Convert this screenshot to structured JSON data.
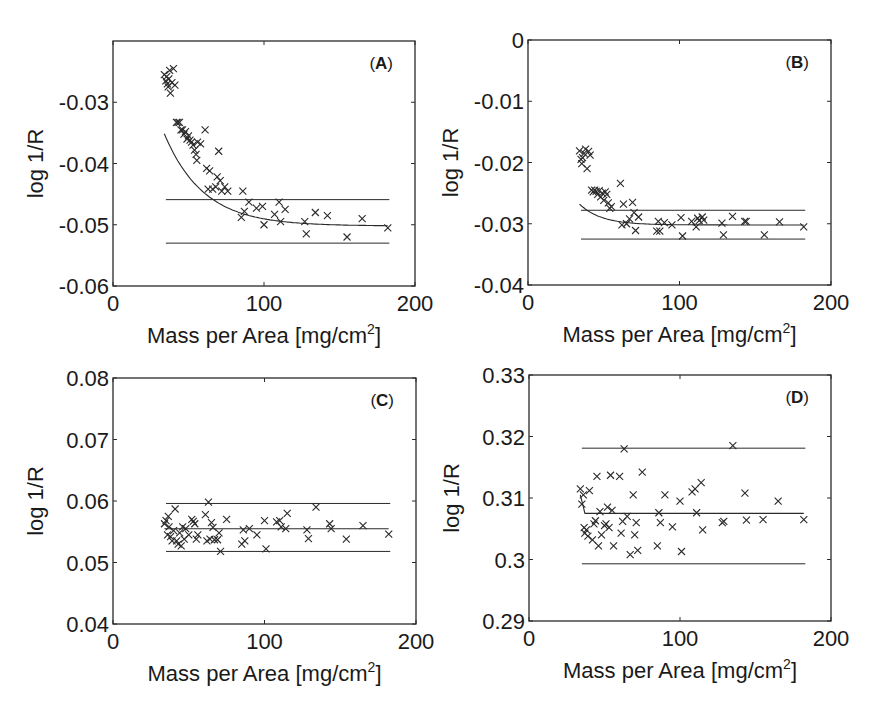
{
  "figure": {
    "width": 881,
    "height": 716,
    "ink_color": "#2a2a2a",
    "marker": "x"
  },
  "chart_data": [
    {
      "id": "A",
      "type": "scatter",
      "panel_label": "(A)",
      "panel_label_bold": "A",
      "xlabel": "Mass per Area [mg/cm",
      "xlabel_sup": "2",
      "xlabel_close": "]",
      "ylabel": "log 1/R",
      "xlim": [
        0,
        200
      ],
      "ylim": [
        -0.06,
        -0.02
      ],
      "xticks": [
        0,
        100,
        200
      ],
      "xtick_labels": [
        "0",
        "100",
        "200"
      ],
      "yticks": [
        -0.06,
        -0.05,
        -0.04,
        -0.03
      ],
      "ytick_labels": [
        "-0.06",
        "-0.05",
        "-0.04",
        "-0.03"
      ],
      "grid": false,
      "box": {
        "left": 113,
        "top": 41,
        "right": 415,
        "bottom": 286
      },
      "points": [
        [
          34,
          -0.0255
        ],
        [
          35,
          -0.0265
        ],
        [
          35.5,
          -0.0258
        ],
        [
          36,
          -0.027
        ],
        [
          36.5,
          -0.0275
        ],
        [
          37,
          -0.0262
        ],
        [
          37.5,
          -0.0248
        ],
        [
          38,
          -0.0285
        ],
        [
          39,
          -0.0268
        ],
        [
          40,
          -0.0245
        ],
        [
          41,
          -0.0272
        ],
        [
          42,
          -0.0333
        ],
        [
          43,
          -0.0333
        ],
        [
          44,
          -0.0333
        ],
        [
          45,
          -0.0345
        ],
        [
          46,
          -0.0345
        ],
        [
          47,
          -0.0352
        ],
        [
          48,
          -0.0348
        ],
        [
          49,
          -0.036
        ],
        [
          50,
          -0.0355
        ],
        [
          51,
          -0.0362
        ],
        [
          52,
          -0.0365
        ],
        [
          53,
          -0.037
        ],
        [
          54,
          -0.0378
        ],
        [
          55,
          -0.0385
        ],
        [
          55.5,
          -0.0395
        ],
        [
          56,
          -0.0365
        ],
        [
          58,
          -0.0368
        ],
        [
          61,
          -0.0345
        ],
        [
          62,
          -0.0408
        ],
        [
          63,
          -0.0442
        ],
        [
          64,
          -0.0412
        ],
        [
          66,
          -0.0442
        ],
        [
          68,
          -0.0438
        ],
        [
          69,
          -0.0422
        ],
        [
          70,
          -0.038
        ],
        [
          71,
          -0.0428
        ],
        [
          72,
          -0.0445
        ],
        [
          74,
          -0.0438
        ],
        [
          76,
          -0.0445
        ],
        [
          85,
          -0.0488
        ],
        [
          86,
          -0.0445
        ],
        [
          87,
          -0.0478
        ],
        [
          90,
          -0.0463
        ],
        [
          95,
          -0.0473
        ],
        [
          99,
          -0.047
        ],
        [
          100,
          -0.05
        ],
        [
          107,
          -0.0483
        ],
        [
          110,
          -0.0463
        ],
        [
          111,
          -0.0495
        ],
        [
          114,
          -0.0475
        ],
        [
          127,
          -0.0495
        ],
        [
          128,
          -0.0515
        ],
        [
          134,
          -0.048
        ],
        [
          142,
          -0.0485
        ],
        [
          155,
          -0.052
        ],
        [
          165,
          -0.049
        ],
        [
          182,
          -0.0505
        ]
      ],
      "fit_curve": {
        "type": "exponential",
        "model": "y = a + b*exp(-x/t)",
        "a": -0.0502,
        "b": 0.0562,
        "t": 25.8,
        "x_range": [
          34,
          182
        ]
      },
      "hlines": [
        {
          "name": "upper",
          "y": -0.0459,
          "x_range": [
            35,
            183
          ]
        },
        {
          "name": "lower",
          "y": -0.053,
          "x_range": [
            35,
            183
          ]
        }
      ]
    },
    {
      "id": "B",
      "type": "scatter",
      "panel_label": "(B)",
      "panel_label_bold": "B",
      "xlabel": "Mass per Area [mg/cm",
      "xlabel_sup": "2",
      "xlabel_close": "]",
      "ylabel": "log 1/R",
      "xlim": [
        0,
        200
      ],
      "ylim": [
        -0.04,
        0
      ],
      "xticks": [
        0,
        100,
        200
      ],
      "xtick_labels": [
        "0",
        "100",
        "200"
      ],
      "yticks": [
        -0.04,
        -0.03,
        -0.02,
        -0.01,
        0
      ],
      "ytick_labels": [
        "-0.04",
        "-0.03",
        "-0.02",
        "-0.01",
        "0"
      ],
      "grid": false,
      "box": {
        "left": 528,
        "top": 40,
        "right": 831,
        "bottom": 285
      },
      "points": [
        [
          34,
          -0.0181
        ],
        [
          35,
          -0.0195
        ],
        [
          35.5,
          -0.0202
        ],
        [
          36,
          -0.0192
        ],
        [
          37,
          -0.0185
        ],
        [
          38,
          -0.0178
        ],
        [
          39,
          -0.021
        ],
        [
          40,
          -0.0182
        ],
        [
          41,
          -0.0188
        ],
        [
          42,
          -0.0245
        ],
        [
          43,
          -0.0248
        ],
        [
          44,
          -0.0245
        ],
        [
          45,
          -0.0247
        ],
        [
          46,
          -0.0252
        ],
        [
          47,
          -0.0246
        ],
        [
          48,
          -0.0256
        ],
        [
          49,
          -0.025
        ],
        [
          50,
          -0.0262
        ],
        [
          51,
          -0.0248
        ],
        [
          52,
          -0.0252
        ],
        [
          53,
          -0.0266
        ],
        [
          54,
          -0.0275
        ],
        [
          55,
          -0.0272
        ],
        [
          61,
          -0.0234
        ],
        [
          62,
          -0.0302
        ],
        [
          63,
          -0.0268
        ],
        [
          65,
          -0.03
        ],
        [
          67,
          -0.0292
        ],
        [
          69,
          -0.0265
        ],
        [
          70,
          -0.0282
        ],
        [
          71,
          -0.0311
        ],
        [
          73,
          -0.0289
        ],
        [
          85,
          -0.0312
        ],
        [
          86,
          -0.0296
        ],
        [
          87,
          -0.0312
        ],
        [
          90,
          -0.0298
        ],
        [
          95,
          -0.0302
        ],
        [
          101,
          -0.029
        ],
        [
          102,
          -0.032
        ],
        [
          108,
          -0.0296
        ],
        [
          111,
          -0.0305
        ],
        [
          112,
          -0.0291
        ],
        [
          113,
          -0.0295
        ],
        [
          115,
          -0.0289
        ],
        [
          116,
          -0.0294
        ],
        [
          128,
          -0.0299
        ],
        [
          129,
          -0.0318
        ],
        [
          135,
          -0.0288
        ],
        [
          143,
          -0.0296
        ],
        [
          144,
          -0.0296
        ],
        [
          156,
          -0.0318
        ],
        [
          166,
          -0.0297
        ],
        [
          182,
          -0.0305
        ]
      ],
      "fit_curve": {
        "type": "exponential",
        "model": "y = a + b*exp(-x/t)",
        "a": -0.0302,
        "b": 0.0355,
        "t": 14.5,
        "x_range": [
          34,
          182
        ]
      },
      "hlines": [
        {
          "name": "upper",
          "y": -0.0278,
          "x_range": [
            35,
            183
          ]
        },
        {
          "name": "lower",
          "y": -0.0325,
          "x_range": [
            35,
            183
          ]
        }
      ]
    },
    {
      "id": "C",
      "type": "scatter",
      "panel_label": "(C)",
      "panel_label_bold": "C",
      "xlabel": "Mass per Area [mg/cm",
      "xlabel_sup": "2",
      "xlabel_close": "]",
      "ylabel": "log 1/R",
      "xlim": [
        0,
        200
      ],
      "ylim": [
        0.04,
        0.08
      ],
      "xticks": [
        0,
        100,
        200
      ],
      "xtick_labels": [
        "0",
        "100",
        "200"
      ],
      "yticks": [
        0.04,
        0.05,
        0.06,
        0.07,
        0.08
      ],
      "ytick_labels": [
        "0.04",
        "0.05",
        "0.06",
        "0.07",
        "0.08"
      ],
      "grid": false,
      "box": {
        "left": 113,
        "top": 378,
        "right": 416,
        "bottom": 624
      },
      "points": [
        [
          34,
          0.0563
        ],
        [
          35,
          0.0568
        ],
        [
          36,
          0.0545
        ],
        [
          36.5,
          0.0575
        ],
        [
          37,
          0.0558
        ],
        [
          38,
          0.0542
        ],
        [
          39,
          0.0535
        ],
        [
          40,
          0.0552
        ],
        [
          41,
          0.0587
        ],
        [
          42,
          0.0535
        ],
        [
          43,
          0.053
        ],
        [
          44,
          0.0548
        ],
        [
          45,
          0.0527
        ],
        [
          46,
          0.0558
        ],
        [
          47,
          0.0538
        ],
        [
          48,
          0.0555
        ],
        [
          50,
          0.0545
        ],
        [
          52,
          0.057
        ],
        [
          53,
          0.0567
        ],
        [
          54,
          0.0563
        ],
        [
          55,
          0.0538
        ],
        [
          56,
          0.0545
        ],
        [
          61,
          0.0578
        ],
        [
          62,
          0.0535
        ],
        [
          63,
          0.0598
        ],
        [
          64,
          0.0538
        ],
        [
          65,
          0.0565
        ],
        [
          66,
          0.0557
        ],
        [
          67,
          0.0537
        ],
        [
          69,
          0.0537
        ],
        [
          70,
          0.0548
        ],
        [
          71,
          0.0518
        ],
        [
          75,
          0.057
        ],
        [
          85,
          0.053
        ],
        [
          86,
          0.0553
        ],
        [
          87,
          0.0535
        ],
        [
          90,
          0.0555
        ],
        [
          95,
          0.0545
        ],
        [
          100,
          0.0568
        ],
        [
          101,
          0.0522
        ],
        [
          108,
          0.0566
        ],
        [
          110,
          0.0568
        ],
        [
          111,
          0.0558
        ],
        [
          114,
          0.0555
        ],
        [
          115,
          0.058
        ],
        [
          128,
          0.0553
        ],
        [
          129,
          0.0539
        ],
        [
          134,
          0.059
        ],
        [
          143,
          0.0563
        ],
        [
          144,
          0.0555
        ],
        [
          154,
          0.0538
        ],
        [
          165,
          0.056
        ],
        [
          182,
          0.0546
        ]
      ],
      "fit_curve": {
        "type": "constant",
        "y": 0.0555,
        "x_range": [
          34,
          182
        ]
      },
      "hlines": [
        {
          "name": "upper",
          "y": 0.0596,
          "x_range": [
            35,
            183
          ]
        },
        {
          "name": "lower",
          "y": 0.0518,
          "x_range": [
            35,
            183
          ]
        }
      ]
    },
    {
      "id": "D",
      "type": "scatter",
      "panel_label": "(D)",
      "panel_label_bold": "D",
      "xlabel": "Mass per Area [mg/cm",
      "xlabel_sup": "2",
      "xlabel_close": "]",
      "ylabel": "log 1/R",
      "xlim": [
        0,
        200
      ],
      "ylim": [
        0.29,
        0.33
      ],
      "xticks": [
        0,
        100,
        200
      ],
      "xtick_labels": [
        "0",
        "100",
        "200"
      ],
      "yticks": [
        0.29,
        0.3,
        0.31,
        0.32,
        0.33
      ],
      "ytick_labels": [
        "0.29",
        "0.3",
        "0.31",
        "0.32",
        "0.33"
      ],
      "grid": false,
      "box": {
        "left": 529,
        "top": 375,
        "right": 831,
        "bottom": 621
      },
      "points": [
        [
          34,
          0.3115
        ],
        [
          35,
          0.309
        ],
        [
          36,
          0.3105
        ],
        [
          36.5,
          0.3052
        ],
        [
          37,
          0.3043
        ],
        [
          38,
          0.3048
        ],
        [
          39,
          0.3038
        ],
        [
          40,
          0.3112
        ],
        [
          42,
          0.3032
        ],
        [
          43,
          0.3058
        ],
        [
          44,
          0.3063
        ],
        [
          45,
          0.3135
        ],
        [
          46,
          0.3022
        ],
        [
          47,
          0.3078
        ],
        [
          48,
          0.304
        ],
        [
          50,
          0.3055
        ],
        [
          51,
          0.3058
        ],
        [
          52,
          0.3085
        ],
        [
          53,
          0.3052
        ],
        [
          54,
          0.3137
        ],
        [
          55,
          0.308
        ],
        [
          56,
          0.3022
        ],
        [
          60,
          0.3135
        ],
        [
          61,
          0.3043
        ],
        [
          62,
          0.3062
        ],
        [
          63,
          0.318
        ],
        [
          65,
          0.307
        ],
        [
          67,
          0.3008
        ],
        [
          69,
          0.3105
        ],
        [
          70,
          0.304
        ],
        [
          71,
          0.306
        ],
        [
          72,
          0.3015
        ],
        [
          75,
          0.3142
        ],
        [
          85,
          0.3022
        ],
        [
          86,
          0.3076
        ],
        [
          87,
          0.306
        ],
        [
          90,
          0.3105
        ],
        [
          95,
          0.3053
        ],
        [
          100,
          0.3095
        ],
        [
          101,
          0.3013
        ],
        [
          108,
          0.311
        ],
        [
          110,
          0.3115
        ],
        [
          111,
          0.3076
        ],
        [
          114,
          0.3125
        ],
        [
          115,
          0.3048
        ],
        [
          128,
          0.306
        ],
        [
          129,
          0.3062
        ],
        [
          135,
          0.3185
        ],
        [
          143,
          0.3108
        ],
        [
          144,
          0.3064
        ],
        [
          155,
          0.3065
        ],
        [
          165,
          0.3095
        ],
        [
          182,
          0.3065
        ]
      ],
      "fit_curve": {
        "type": "step-then-constant",
        "y": 0.3075,
        "start_y": 0.3105,
        "x_range": [
          34,
          182
        ]
      },
      "hlines": [
        {
          "name": "upper",
          "y": 0.3181,
          "x_range": [
            35,
            183
          ]
        },
        {
          "name": "lower",
          "y": 0.2993,
          "x_range": [
            35,
            183
          ]
        }
      ]
    }
  ]
}
